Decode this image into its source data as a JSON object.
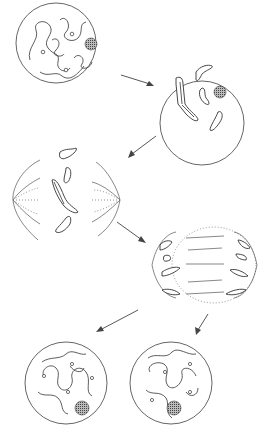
{
  "diagram": {
    "stages": [
      {
        "id": "interphase",
        "label": "",
        "shape": "circle",
        "cx": 56,
        "cy": 43,
        "r": 40
      },
      {
        "id": "prophase",
        "label": "",
        "shape": "circle",
        "cx": 202,
        "cy": 123,
        "r": 42
      },
      {
        "id": "metaphase",
        "label": "",
        "shape": "spindle",
        "cx": 72,
        "cy": 200
      },
      {
        "id": "anaphase",
        "label": "",
        "shape": "ellipse",
        "cx": 214,
        "cy": 265
      },
      {
        "id": "daughter-cell-1",
        "label": "",
        "shape": "circle",
        "cx": 66,
        "cy": 383,
        "r": 41
      },
      {
        "id": "daughter-cell-2",
        "label": "",
        "shape": "circle",
        "cx": 171,
        "cy": 383,
        "r": 41
      }
    ],
    "arrows": [
      {
        "from": "interphase",
        "to": "prophase"
      },
      {
        "from": "prophase",
        "to": "metaphase"
      },
      {
        "from": "metaphase",
        "to": "anaphase"
      },
      {
        "from": "anaphase",
        "to": "daughter-cell-1"
      },
      {
        "from": "anaphase",
        "to": "daughter-cell-2"
      }
    ],
    "colors": {
      "line": "#333333",
      "background": "#ffffff",
      "nucleolus": "#666666"
    }
  }
}
